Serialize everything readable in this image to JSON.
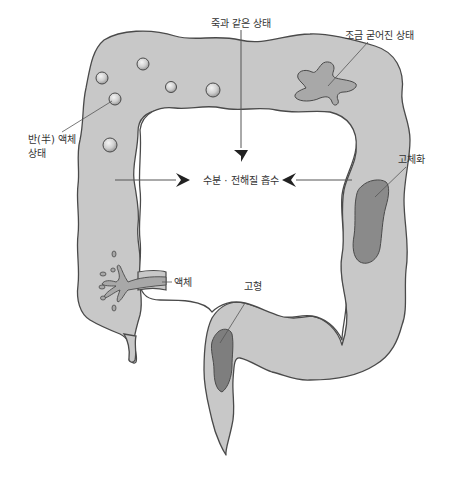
{
  "diagram": {
    "colors": {
      "colon_fill": "#c8c8c8",
      "colon_stroke": "#4a4a4a",
      "stool_dark": "#8a8a8a",
      "stool_medium": "#a8a8a8",
      "ball_fill": "#d6d6d6",
      "arrow": "#222222",
      "leader": "#555555",
      "text": "#333333"
    },
    "labels": {
      "porridge_state": "죽과 같은 상태",
      "slightly_hardened": "조금 굳어진 상태",
      "semi_liquid_line1": "반(半) 액체",
      "semi_liquid_line2": "상태",
      "water_absorption": "수분 · 전해질 흡수",
      "solidification": "고체화",
      "liquid": "액체",
      "solid_form": "고형"
    },
    "stages": [
      {
        "name": "액체",
        "region": "ascending colon (bottom)"
      },
      {
        "name": "반(半) 액체 상태",
        "region": "ascending colon (top)"
      },
      {
        "name": "죽과 같은 상태",
        "region": "transverse colon"
      },
      {
        "name": "조금 굳어진 상태",
        "region": "transverse colon (right)"
      },
      {
        "name": "고체화",
        "region": "descending colon"
      },
      {
        "name": "고형",
        "region": "sigmoid colon / rectum"
      }
    ],
    "arrows": [
      {
        "from": "top",
        "to": "center",
        "label_ref": "water_absorption"
      },
      {
        "from": "left",
        "to": "center",
        "label_ref": "water_absorption"
      },
      {
        "from": "right",
        "to": "center",
        "label_ref": "water_absorption"
      }
    ]
  }
}
